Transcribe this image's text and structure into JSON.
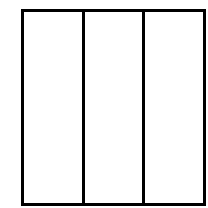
{
  "diagram": {
    "shape": "rectangle-divided-into-columns",
    "column_count": 3,
    "stroke_color": "#000000",
    "fill_color": "#ffffff",
    "columns": [
      {
        "index": 1,
        "label": ""
      },
      {
        "index": 2,
        "label": ""
      },
      {
        "index": 3,
        "label": ""
      }
    ]
  }
}
